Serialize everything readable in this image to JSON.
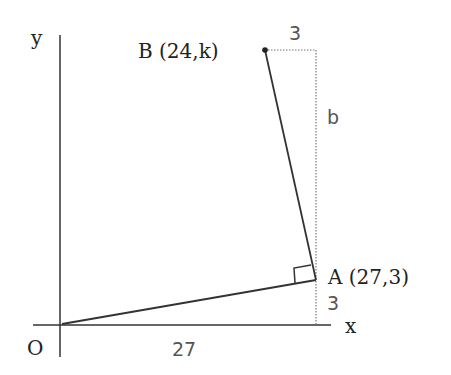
{
  "diagram": {
    "axes": {
      "x_label": "x",
      "y_label": "y",
      "origin_label": "O"
    },
    "points": {
      "A": {
        "label": "A (27,3)",
        "coords": [
          27,
          3
        ]
      },
      "B": {
        "label": "B (24,k)",
        "coords": [
          24,
          "k"
        ]
      }
    },
    "dimensions": {
      "horizontal_OA": "27",
      "vertical_A_to_axis": "3",
      "horizontal_B_offset": "3",
      "vertical_b": "b"
    },
    "annotations": {
      "right_angle_at": "A"
    },
    "colors": {
      "line": "#333333",
      "dotted": "#777777",
      "text": "#222222",
      "dim_text": "#555555"
    }
  }
}
